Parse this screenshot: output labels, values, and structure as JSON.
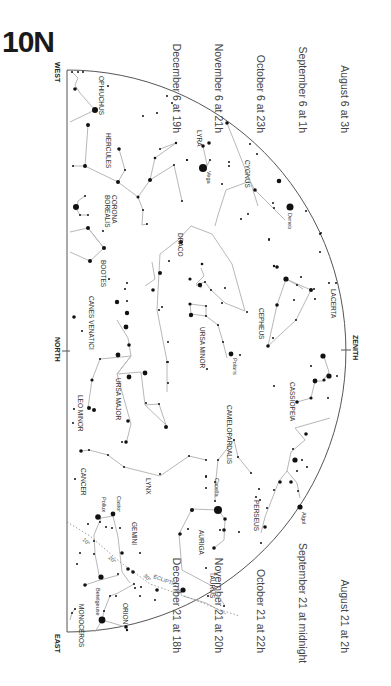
{
  "title": "10N",
  "times_top": [
    {
      "date": "August 6 at",
      "hour": "3h"
    },
    {
      "date": "September 6 at",
      "hour": "1h"
    },
    {
      "date": "October 6 at",
      "hour": "23h"
    },
    {
      "date": "November 6 at",
      "hour": "21h"
    },
    {
      "date": "December 6 at",
      "hour": "19h"
    }
  ],
  "times_bottom": [
    {
      "date": "August 21 at",
      "hour": "2h"
    },
    {
      "date": "September 21 at",
      "hour": "midnight"
    },
    {
      "date": "October 21 at",
      "hour": "22h"
    },
    {
      "date": "November 21 at",
      "hour": "20h"
    },
    {
      "date": "December 21 at",
      "hour": "18h"
    }
  ],
  "directions": {
    "west": "WEST",
    "north": "NORTH",
    "east": "EAST",
    "zenith": "ZENITH"
  },
  "ecliptic_label": "ECLIPTIC",
  "ecliptic_marks": [
    "10°",
    "20°",
    "30°",
    "40°",
    "50°"
  ],
  "constellations": [
    {
      "name": "OPHIUCHUS",
      "x": 98,
      "y": 78
    },
    {
      "name": "HERCULES",
      "x": 105,
      "y": 133
    },
    {
      "name": "LYRA",
      "x": 199,
      "y": 130
    },
    {
      "name": "CYGNUS",
      "x": 244,
      "y": 160
    },
    {
      "name": "CORONA",
      "x": 111,
      "y": 195
    },
    {
      "name": "BOREALIS",
      "x": 104,
      "y": 195
    },
    {
      "name": "DRACO",
      "x": 178,
      "y": 232
    },
    {
      "name": "BOOTES",
      "x": 100,
      "y": 260
    },
    {
      "name": "CEPHEUS",
      "x": 258,
      "y": 310
    },
    {
      "name": "LACERTA",
      "x": 330,
      "y": 290
    },
    {
      "name": "CANES VENATICI",
      "x": 88,
      "y": 297
    },
    {
      "name": "URSA MINOR",
      "x": 198,
      "y": 327
    },
    {
      "name": "CASSIOPEIA",
      "x": 289,
      "y": 382
    },
    {
      "name": "URSA MAJOR",
      "x": 115,
      "y": 378
    },
    {
      "name": "LEO MINOR",
      "x": 77,
      "y": 395
    },
    {
      "name": "CAMELOPARDALIS",
      "x": 226,
      "y": 405
    },
    {
      "name": "LYNX",
      "x": 145,
      "y": 478
    },
    {
      "name": "CANCER",
      "x": 80,
      "y": 468
    },
    {
      "name": "PERSEUS",
      "x": 253,
      "y": 500
    },
    {
      "name": "GEMINI",
      "x": 131,
      "y": 522
    },
    {
      "name": "AURIGA",
      "x": 198,
      "y": 530
    },
    {
      "name": "TAURUS",
      "x": 209,
      "y": 572
    },
    {
      "name": "ORION",
      "x": 122,
      "y": 605
    },
    {
      "name": "MONOCEROS",
      "x": 78,
      "y": 610
    }
  ],
  "named_stars": [
    {
      "name": "Vega",
      "x": 206,
      "y": 171
    },
    {
      "name": "Deneb",
      "x": 287,
      "y": 207
    },
    {
      "name": "Polaris",
      "x": 234,
      "y": 354
    },
    {
      "name": "Capella",
      "x": 214,
      "y": 479
    },
    {
      "name": "Castor",
      "x": 116,
      "y": 512
    },
    {
      "name": "Pollux",
      "x": 101,
      "y": 515
    },
    {
      "name": "Algol",
      "x": 302,
      "y": 513
    },
    {
      "name": "Betelgeuse",
      "x": 96,
      "y": 623
    }
  ]
}
